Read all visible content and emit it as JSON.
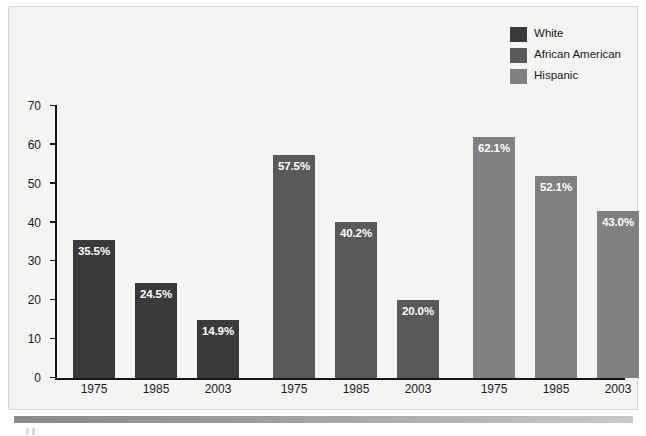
{
  "chart_data": {
    "type": "bar",
    "title": "",
    "subtitle": "",
    "xlabel": "",
    "ylabel": "",
    "categories": [
      "1975",
      "1985",
      "2003"
    ],
    "ylim": [
      0,
      70
    ],
    "yticks": [
      0,
      10,
      20,
      30,
      40,
      50,
      60,
      70
    ],
    "ytick_labels": [
      "0",
      "10",
      "20",
      "30",
      "40",
      "50",
      "60",
      "70"
    ],
    "grid": false,
    "legend_position": "top-right",
    "series": [
      {
        "name": "White",
        "color": "#3a3a3a",
        "values": [
          35.5,
          24.5,
          14.9
        ],
        "labels": [
          "35.5%",
          "24.5%",
          "14.9%"
        ]
      },
      {
        "name": "African American",
        "color": "#595959",
        "values": [
          57.5,
          40.2,
          20.0
        ],
        "labels": [
          "57.5%",
          "40.2%",
          "20.0%"
        ]
      },
      {
        "name": "Hispanic",
        "color": "#808080",
        "values": [
          62.1,
          52.1,
          43.0
        ],
        "labels": [
          "62.1%",
          "43.0%",
          "52.1%"
        ]
      }
    ],
    "bars": [
      {
        "series": "White",
        "category": "1975",
        "value": 35.5,
        "label": "35.5%",
        "color": "#3a3a3a"
      },
      {
        "series": "White",
        "category": "1985",
        "value": 24.5,
        "label": "24.5%",
        "color": "#3a3a3a"
      },
      {
        "series": "White",
        "category": "2003",
        "value": 14.9,
        "label": "14.9%",
        "color": "#3a3a3a"
      },
      {
        "series": "African American",
        "category": "1975",
        "value": 57.5,
        "label": "57.5%",
        "color": "#595959"
      },
      {
        "series": "African American",
        "category": "1985",
        "value": 40.2,
        "label": "40.2%",
        "color": "#595959"
      },
      {
        "series": "African American",
        "category": "2003",
        "value": 20.0,
        "label": "20.0%",
        "color": "#595959"
      },
      {
        "series": "Hispanic",
        "category": "1975",
        "value": 62.1,
        "label": "62.1%",
        "color": "#808080"
      },
      {
        "series": "Hispanic",
        "category": "1985",
        "value": 52.1,
        "label": "52.1%",
        "color": "#808080"
      },
      {
        "series": "Hispanic",
        "category": "2003",
        "value": 43.0,
        "label": "43.0%",
        "color": "#808080"
      }
    ]
  },
  "legend": {
    "items": [
      {
        "label": "White",
        "color": "#3a3a3a"
      },
      {
        "label": "African American",
        "color": "#595959"
      },
      {
        "label": "Hispanic",
        "color": "#808080"
      }
    ]
  },
  "colors": {
    "panel_background": "#f4f4f2",
    "panel_border": "#d8d8d4",
    "axis": "#161616",
    "text": "#1b1b1b",
    "value_label": "#ffffff",
    "series_white": "#3a3a3a",
    "series_african_american": "#595959",
    "series_hispanic": "#808080"
  }
}
